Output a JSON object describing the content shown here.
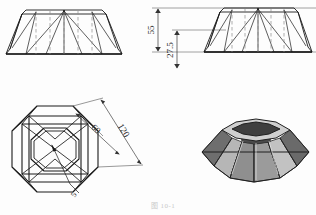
{
  "drawing": {
    "title": "Octagonal lampshade technical drawing",
    "caption": "图 10-1",
    "line_color": "#1a1a1a",
    "hidden_line_color": "#8a8a8a",
    "dimension_color": "#333333",
    "shade_dark": "#5e5e5e",
    "shade_mid": "#7d7d7d",
    "shade_light": "#b9b9b9",
    "shade_lighter": "#d2d2d2",
    "background": "#fdfdfd"
  },
  "views": {
    "elevation_front": {
      "name": "front elevation",
      "label": ""
    },
    "elevation_dimensioned": {
      "name": "dimensioned elevation",
      "dimensions": [
        {
          "id": "height-overall",
          "value": "55",
          "unit": "",
          "orientation": "vertical"
        },
        {
          "id": "height-lower",
          "value": "27.5",
          "unit": "",
          "orientation": "vertical"
        }
      ]
    },
    "plan": {
      "name": "plan view",
      "dimensions": [
        {
          "id": "inner-width",
          "value": "60",
          "unit": "",
          "orientation": "diagonal"
        },
        {
          "id": "outer-width",
          "value": "120",
          "unit": "",
          "orientation": "diagonal"
        },
        {
          "id": "thickness",
          "value": "5",
          "unit": "",
          "orientation": "diagonal"
        }
      ]
    },
    "isometric": {
      "name": "isometric shaded view",
      "label": ""
    }
  }
}
